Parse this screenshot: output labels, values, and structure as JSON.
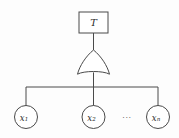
{
  "diagram": {
    "type": "fault-tree",
    "title": "",
    "background_color": "#fdfdfd",
    "stroke_color": "#4a4a4a",
    "top_event": {
      "shape": "rectangle",
      "label": "T"
    },
    "gate": {
      "shape": "or-gate",
      "label": ""
    },
    "ellipsis": "···",
    "basic_events": [
      {
        "shape": "circle",
        "base": "x",
        "subscript": "1"
      },
      {
        "shape": "circle",
        "base": "x",
        "subscript": "2"
      },
      {
        "shape": "circle",
        "base": "x",
        "subscript": "n"
      }
    ]
  }
}
